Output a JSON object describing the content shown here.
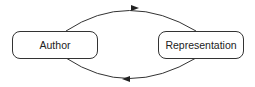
{
  "diagram": {
    "nodes": [
      {
        "id": "author",
        "label": "Author"
      },
      {
        "id": "representation",
        "label": "Representation"
      }
    ],
    "edges": [
      {
        "from": "author",
        "to": "representation",
        "path": "top-arc"
      },
      {
        "from": "representation",
        "to": "author",
        "path": "bottom-arc"
      }
    ],
    "colors": {
      "stroke": "#333333",
      "background": "#ffffff"
    }
  }
}
